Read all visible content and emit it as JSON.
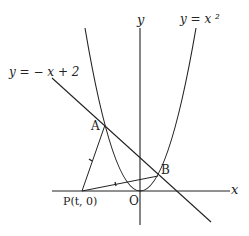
{
  "labels": {
    "y_axis": "y",
    "x_axis": "x",
    "parabola": "y = x ²",
    "line": "y = − x + 2",
    "point_a": "A",
    "point_b": "B",
    "point_p": "P(t,  0)",
    "origin": "O"
  },
  "geometry": {
    "origin": [
      0,
      0
    ],
    "A": [
      -2,
      4
    ],
    "B": [
      1,
      1
    ],
    "P": [
      -3.3,
      0
    ]
  },
  "colors": {
    "ink": "#222222",
    "background": "#ffffff"
  }
}
